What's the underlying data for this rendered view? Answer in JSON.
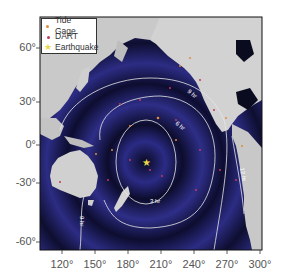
{
  "map": {
    "title": "",
    "type": "tsunami travel time map",
    "legend": {
      "items": [
        {
          "label": "Tide Gage",
          "symbol": "dot",
          "color": "#e08a3a"
        },
        {
          "label": "DART",
          "symbol": "dot",
          "color": "#c23a5a"
        },
        {
          "label": "Earthquake",
          "symbol": "star",
          "color": "#e8d84a"
        }
      ]
    },
    "x_axis": {
      "ticks": [
        "120°",
        "150°",
        "180°",
        "210°",
        "240°",
        "270°",
        "300°"
      ]
    },
    "y_axis": {
      "ticks": [
        "60°",
        "30°",
        "0°",
        "-30°",
        "-60°"
      ]
    },
    "contours": [
      {
        "label": "3 hr"
      },
      {
        "label": "6 hr"
      },
      {
        "label": "9 hr"
      },
      {
        "label": "12 hr"
      }
    ],
    "colors": {
      "ocean_deep": "#0b0b2e",
      "ocean": "#2a2a7a",
      "land": "#c8c8c8",
      "contour": "#e6e6e6",
      "frame": "#111111"
    }
  }
}
